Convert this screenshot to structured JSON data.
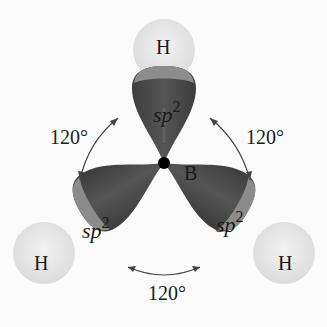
{
  "diagram": {
    "central_atom": {
      "symbol": "B"
    },
    "hydrogens": [
      {
        "position": "top",
        "symbol": "H"
      },
      {
        "position": "bottom-left",
        "symbol": "H"
      },
      {
        "position": "bottom-right",
        "symbol": "H"
      }
    ],
    "orbitals": [
      {
        "position": "top",
        "label": "sp",
        "superscript": "2"
      },
      {
        "position": "bottom-left",
        "label": "sp",
        "superscript": "2"
      },
      {
        "position": "bottom-right",
        "label": "sp",
        "superscript": "2"
      }
    ],
    "angles": [
      {
        "position": "upper-left",
        "label": "120°"
      },
      {
        "position": "upper-right",
        "label": "120°"
      },
      {
        "position": "bottom",
        "label": "120°"
      }
    ],
    "colors": {
      "lobe": "#4a4a4a",
      "lobe_cap": "#8a8a8a",
      "hydrogen": "#e6e6e6",
      "nucleus": "#000000",
      "arrow": "#444444",
      "background": "#fbfbfb"
    }
  }
}
